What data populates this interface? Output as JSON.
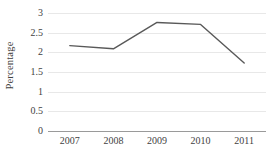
{
  "chart_data": {
    "type": "line",
    "title": "",
    "subtitle": "",
    "xlabel": "",
    "ylabel": "Percentage",
    "categories": [
      "2007",
      "2008",
      "2009",
      "2010",
      "2011"
    ],
    "values": [
      2.17,
      2.09,
      2.76,
      2.71,
      1.73
    ],
    "series": [
      {
        "name": "Percentage",
        "values": [
          2.17,
          2.09,
          2.76,
          2.71,
          1.73
        ],
        "color": "#595959"
      }
    ],
    "ylim": [
      0,
      3
    ],
    "ytick_step": 0.5,
    "ytick_labels": [
      "0",
      "0.5",
      "1",
      "1.5",
      "2",
      "2.5",
      "3"
    ],
    "ytick_values": [
      0,
      0.5,
      1,
      1.5,
      2,
      2.5,
      3
    ],
    "xtick_labels": [
      "2007",
      "2008",
      "2009",
      "2010",
      "2011"
    ],
    "grid": true,
    "grid_axis": "y",
    "grid_color": "#e8e8e8",
    "axis_color": "#9a9a9a",
    "legend": false,
    "legend_position": "none",
    "markers": false,
    "line_width": 1.4,
    "background": "#ffffff",
    "text_color": "#3f3f3f",
    "annotations": []
  }
}
